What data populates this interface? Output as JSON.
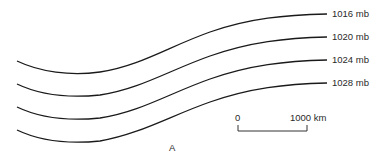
{
  "diagram": {
    "title": "",
    "isobars": [
      {
        "label": "1016 mb",
        "value": 1016
      },
      {
        "label": "1020 mb",
        "value": 1020
      },
      {
        "label": "1024 mb",
        "value": 1024
      },
      {
        "label": "1028 mb",
        "value": 1028
      }
    ],
    "scale_bar": {
      "start_label": "0",
      "end_label": "1000 km"
    },
    "point_label": "A",
    "line_color": "#1a1a1a"
  }
}
